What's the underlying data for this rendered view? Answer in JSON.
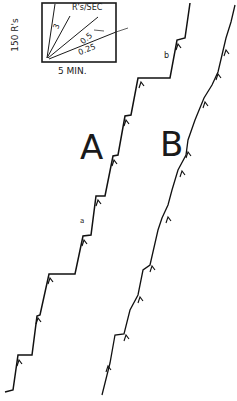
{
  "chart_data": {
    "type": "line",
    "title": "",
    "scale_inset": {
      "y_scale_label": "150 R's",
      "x_scale_label": "5 MIN.",
      "rate_title": "R's/SEC",
      "rate_lines": [
        "3",
        "1",
        "0.5",
        "0.25"
      ]
    },
    "series": [
      {
        "name": "A",
        "annotations": [
          "a",
          "b"
        ],
        "points_px": [
          [
            5,
            392
          ],
          [
            13,
            390
          ],
          [
            18,
            355
          ],
          [
            32,
            355
          ],
          [
            37,
            316
          ],
          [
            40,
            315
          ],
          [
            49,
            274
          ],
          [
            75,
            274
          ],
          [
            83,
            236
          ],
          [
            91,
            235
          ],
          [
            96,
            196
          ],
          [
            105,
            196
          ],
          [
            113,
            156
          ],
          [
            118,
            155
          ],
          [
            125,
            116
          ],
          [
            131,
            115
          ],
          [
            138,
            78
          ],
          [
            170,
            78
          ],
          [
            177,
            40
          ],
          [
            185,
            38
          ],
          [
            190,
            3
          ]
        ]
      },
      {
        "name": "B",
        "annotations": [],
        "points_px": [
          [
            102,
            395
          ],
          [
            110,
            363
          ],
          [
            115,
            335
          ],
          [
            124,
            334
          ],
          [
            130,
            310
          ],
          [
            138,
            295
          ],
          [
            143,
            270
          ],
          [
            150,
            265
          ],
          [
            158,
            230
          ],
          [
            162,
            218
          ],
          [
            168,
            205
          ],
          [
            172,
            190
          ],
          [
            178,
            170
          ],
          [
            186,
            155
          ],
          [
            188,
            140
          ],
          [
            195,
            120
          ],
          [
            204,
            98
          ],
          [
            212,
            85
          ],
          [
            218,
            72
          ],
          [
            222,
            55
          ],
          [
            226,
            38
          ],
          [
            231,
            22
          ],
          [
            235,
            5
          ]
        ]
      }
    ],
    "xlabel": "time",
    "ylabel": "cumulative responses",
    "grid": false,
    "legend": "none"
  },
  "labels": {
    "curve_a": "A",
    "curve_b": "B",
    "mark_a": "a",
    "mark_b": "b",
    "inset_y": "150 R's",
    "inset_x": "5 MIN.",
    "inset_title": "R's/SEC",
    "rate_3": "3",
    "rate_05": "0.5",
    "rate_025": "0.25"
  }
}
